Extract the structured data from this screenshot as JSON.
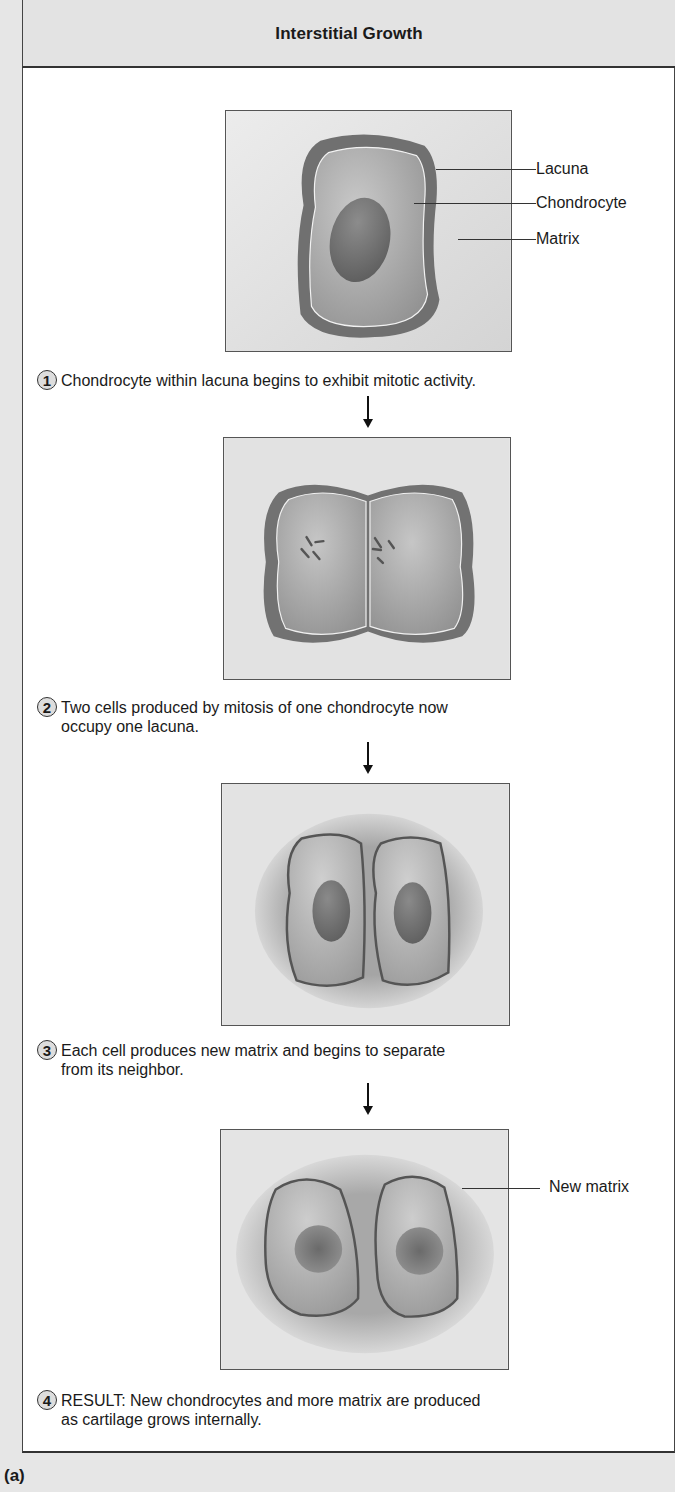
{
  "header": {
    "title": "Interstitial Growth"
  },
  "stages": [
    {
      "number": "1",
      "caption": "Chondrocyte within lacuna begins to exhibit mitotic activity.",
      "labels": [
        "Lacuna",
        "Chondrocyte",
        "Matrix"
      ]
    },
    {
      "number": "2",
      "caption_line1": "Two cells produced by mitosis of one chondrocyte now",
      "caption_line2": "occupy one lacuna."
    },
    {
      "number": "3",
      "caption_line1": "Each cell produces new matrix and begins to separate",
      "caption_line2": "from its neighbor."
    },
    {
      "number": "4",
      "caption_line1": "RESULT: New chondrocytes and more matrix are produced",
      "caption_line2": "as cartilage grows internally.",
      "labels": [
        "New matrix"
      ]
    }
  ],
  "panel_label": "(a)",
  "colors": {
    "matrix": "#d9d9d9",
    "lacuna": "#6e6e6e",
    "cell": "#a9a9a9",
    "nucleus": "#6a6a6a",
    "border": "#444444"
  }
}
